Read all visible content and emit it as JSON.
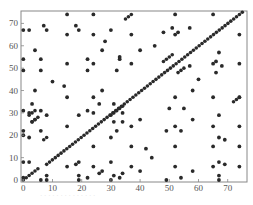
{
  "chart_data": {
    "type": "scatter",
    "title": "",
    "xlabel": "",
    "ylabel": "",
    "xlim": [
      -0.5,
      75.5
    ],
    "ylim": [
      -0.5,
      76
    ],
    "x_ticks": [
      0,
      10,
      20,
      30,
      40,
      50,
      60,
      70
    ],
    "y_ticks": [
      0,
      10,
      20,
      30,
      40,
      50,
      60,
      70
    ],
    "grid": false,
    "legend": null,
    "marker_color": "#2a2a2a",
    "diagonal_segments": [
      {
        "from": [
          0,
          0
        ],
        "to": [
          5,
          5
        ]
      },
      {
        "from": [
          8,
          7
        ],
        "to": [
          75,
          75
        ]
      },
      {
        "from": [
          30,
          29
        ],
        "to": [
          34,
          33
        ]
      },
      {
        "from": [
          35,
          72
        ],
        "to": [
          37,
          74
        ]
      },
      {
        "from": [
          48,
          53
        ],
        "to": [
          51,
          56
        ]
      },
      {
        "from": [
          53,
          48
        ],
        "to": [
          55,
          50
        ]
      },
      {
        "from": [
          72,
          35
        ],
        "to": [
          74,
          37
        ]
      },
      {
        "from": [
          2,
          29
        ],
        "to": [
          4,
          31
        ]
      },
      {
        "from": [
          3,
          26
        ],
        "to": [
          5,
          28
        ]
      },
      {
        "from": [
          7,
          18
        ],
        "to": [
          8,
          19
        ]
      }
    ],
    "points": [
      [
        15,
        74
      ],
      [
        24,
        74
      ],
      [
        52,
        74
      ],
      [
        65,
        74
      ],
      [
        0,
        67
      ],
      [
        2,
        67
      ],
      [
        8,
        67
      ],
      [
        19,
        67
      ],
      [
        30,
        67
      ],
      [
        7,
        69
      ],
      [
        18,
        69
      ],
      [
        51,
        68
      ],
      [
        57,
        68
      ],
      [
        48,
        66
      ],
      [
        53,
        66
      ],
      [
        15,
        65
      ],
      [
        24,
        65
      ],
      [
        37,
        65
      ],
      [
        52,
        65
      ],
      [
        74,
        65
      ],
      [
        28,
        62
      ],
      [
        45,
        60
      ],
      [
        4,
        58
      ],
      [
        27,
        58
      ],
      [
        40,
        58
      ],
      [
        67,
        57
      ],
      [
        0,
        54
      ],
      [
        6,
        54
      ],
      [
        22,
        54
      ],
      [
        33,
        54
      ],
      [
        33,
        55
      ],
      [
        66,
        53
      ],
      [
        15,
        52
      ],
      [
        24,
        52
      ],
      [
        37,
        52
      ],
      [
        65,
        52
      ],
      [
        74,
        52
      ],
      [
        57,
        51
      ],
      [
        68,
        51
      ],
      [
        0,
        49
      ],
      [
        6,
        49
      ],
      [
        22,
        49
      ],
      [
        32,
        49
      ],
      [
        66,
        48
      ],
      [
        10,
        44
      ],
      [
        14,
        42
      ],
      [
        60,
        45
      ],
      [
        4,
        40
      ],
      [
        27,
        40
      ],
      [
        58,
        40
      ],
      [
        15,
        37
      ],
      [
        24,
        37
      ],
      [
        52,
        37
      ],
      [
        65,
        37
      ],
      [
        74,
        37
      ],
      [
        3,
        34
      ],
      [
        26,
        34
      ],
      [
        31,
        34
      ],
      [
        0,
        31
      ],
      [
        6,
        31
      ],
      [
        22,
        31
      ],
      [
        55,
        32
      ],
      [
        50,
        32
      ],
      [
        2,
        30
      ],
      [
        24,
        30
      ],
      [
        34,
        30
      ],
      [
        8,
        29
      ],
      [
        19,
        29
      ],
      [
        67,
        29
      ],
      [
        4,
        27
      ],
      [
        40,
        27
      ],
      [
        58,
        27
      ],
      [
        3,
        26
      ],
      [
        31,
        26
      ],
      [
        34,
        26
      ],
      [
        15,
        24
      ],
      [
        37,
        24
      ],
      [
        52,
        24
      ],
      [
        65,
        24
      ],
      [
        74,
        24
      ],
      [
        0,
        22
      ],
      [
        6,
        22
      ],
      [
        32,
        22
      ],
      [
        49,
        22
      ],
      [
        54,
        22
      ],
      [
        0,
        20
      ],
      [
        2,
        19
      ],
      [
        30,
        19
      ],
      [
        67,
        19
      ],
      [
        69,
        18
      ],
      [
        24,
        15
      ],
      [
        37,
        15
      ],
      [
        52,
        15
      ],
      [
        65,
        15
      ],
      [
        74,
        15
      ],
      [
        42,
        14
      ],
      [
        44,
        10
      ],
      [
        0,
        8
      ],
      [
        2,
        8
      ],
      [
        19,
        8
      ],
      [
        30,
        8
      ],
      [
        67,
        8
      ],
      [
        18,
        7
      ],
      [
        69,
        7
      ],
      [
        15,
        6
      ],
      [
        24,
        6
      ],
      [
        37,
        6
      ],
      [
        52,
        6
      ],
      [
        65,
        6
      ],
      [
        74,
        6
      ],
      [
        27,
        4
      ],
      [
        40,
        4
      ],
      [
        58,
        4
      ],
      [
        26,
        3
      ],
      [
        34,
        3
      ],
      [
        8,
        2
      ],
      [
        19,
        2
      ],
      [
        31,
        2
      ],
      [
        67,
        2
      ],
      [
        0,
        1
      ],
      [
        22,
        1
      ],
      [
        33,
        1
      ],
      [
        54,
        1
      ],
      [
        6,
        0
      ],
      [
        8,
        0
      ],
      [
        19,
        0
      ],
      [
        30,
        0
      ],
      [
        49,
        0
      ],
      [
        67,
        0
      ]
    ]
  },
  "caption": "· · · · · · · · · · · · · ·"
}
